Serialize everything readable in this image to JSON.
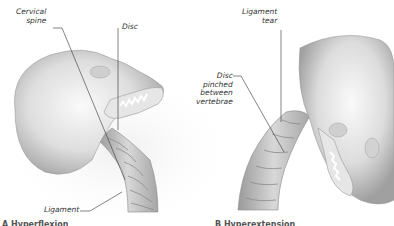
{
  "figure": {
    "panels": [
      {
        "id": "flexion",
        "labels": {
          "cervical_spine_line1": "Cervical",
          "cervical_spine_line2": "spine",
          "disc": "Disc",
          "ligament": "Ligament"
        },
        "caption": "A  Hyperflexion"
      },
      {
        "id": "extension",
        "labels": {
          "ligament_tear_line1": "Ligament",
          "ligament_tear_line2": "tear",
          "disc_pinched_line1": "Disc",
          "disc_pinched_line2": "pinched",
          "disc_pinched_line3": "between",
          "disc_pinched_line4": "vertebrae"
        },
        "caption": "B  Hyperextension"
      }
    ],
    "colors": {
      "background": "#ffffff",
      "bone_light": "#f2f2f2",
      "bone_mid": "#c8c8c8",
      "bone_dark": "#8c8c8c",
      "leader_line": "#333333",
      "label_text": "#333333",
      "shadow_halo": "#ececec"
    }
  }
}
